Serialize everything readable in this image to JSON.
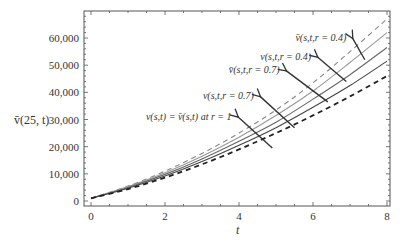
{
  "chart_data": {
    "type": "line",
    "title": "",
    "xlabel": "t",
    "ylabel": "v̄(25, t)",
    "xlim": [
      0,
      8
    ],
    "ylim": [
      0,
      70000
    ],
    "xticks": [
      0,
      2,
      4,
      6,
      8
    ],
    "xtick_labels": [
      "0",
      "2",
      "4",
      "6",
      "8"
    ],
    "yticks": [
      0,
      10000,
      20000,
      30000,
      40000,
      50000,
      60000
    ],
    "ytick_labels": [
      "0",
      "10,000",
      "20,000",
      "30,000",
      "40,000",
      "50,000",
      "60,000"
    ],
    "grid": false,
    "x": [
      0,
      1,
      2,
      3,
      4,
      5,
      6,
      7,
      8
    ],
    "series": [
      {
        "name": "v̄(s,t,r=0.4)",
        "style": "dashed",
        "color": "#888888",
        "values": [
          1000,
          5500,
          11000,
          17500,
          25000,
          33500,
          43500,
          55000,
          67000
        ]
      },
      {
        "name": "v(s,t,r=0.4)",
        "style": "solid",
        "color": "#999999",
        "values": [
          1000,
          5300,
          10400,
          16500,
          23500,
          31500,
          40500,
          51000,
          62000
        ]
      },
      {
        "name": "v̄(s,t,r=0.7)",
        "style": "solid",
        "color": "#666666",
        "values": [
          1000,
          5000,
          9800,
          15500,
          22000,
          29000,
          37500,
          46500,
          56500
        ]
      },
      {
        "name": "v(s,t,r=0.7)",
        "style": "solid",
        "color": "#444444",
        "values": [
          1000,
          4700,
          9200,
          14500,
          20500,
          27000,
          34500,
          42500,
          51500
        ]
      },
      {
        "name": "v(s,t)=v̄(s,t) at r=1",
        "style": "dashed",
        "color": "#222222",
        "values": [
          1000,
          4400,
          8600,
          13500,
          19000,
          25000,
          31500,
          38500,
          46000
        ]
      }
    ],
    "annotations": [
      {
        "text": "v̄(s,t,r = 0.4)",
        "label_xy": [
          6.9,
          59000
        ],
        "arrow_to": [
          7.4,
          52000
        ]
      },
      {
        "text": "v(s,t,r = 0.4)",
        "label_xy": [
          5.95,
          52000
        ],
        "arrow_to": [
          6.9,
          44000
        ]
      },
      {
        "text": "v̄(s,t,r = 0.7)",
        "label_xy": [
          5.1,
          47000
        ],
        "arrow_to": [
          6.4,
          36500
        ]
      },
      {
        "text": "v(s,t,r = 0.7)",
        "label_xy": [
          4.4,
          37500
        ],
        "arrow_to": [
          5.5,
          27000
        ]
      },
      {
        "text": "v(s,t) = v̄(s,t) at r = 1",
        "label_xy": [
          3.8,
          30000
        ],
        "arrow_to": [
          4.9,
          19500
        ]
      }
    ]
  },
  "labels": {
    "ylabel_main": "v̄(25, t)",
    "xlabel": "t"
  }
}
